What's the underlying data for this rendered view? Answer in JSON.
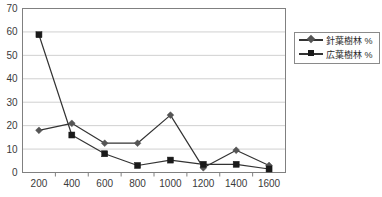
{
  "chart_data": {
    "type": "line",
    "title": "",
    "subtitle": "",
    "xlabel": "",
    "ylabel": "",
    "categories": [
      "200",
      "400",
      "600",
      "800",
      "1000",
      "1200",
      "1400",
      "1600"
    ],
    "series": [
      {
        "name": "針葉樹林 %",
        "marker": "diamond",
        "color": "#555555",
        "values": [
          18,
          21,
          12.5,
          12.5,
          24.5,
          2,
          9.5,
          3
        ]
      },
      {
        "name": "広葉樹林 %",
        "marker": "square",
        "color": "#1a1a1a",
        "values": [
          58.8,
          16,
          8,
          3,
          5.3,
          3.5,
          3.5,
          1.5
        ]
      }
    ],
    "ylim": [
      0,
      70
    ],
    "ytick_step": 10,
    "yticks": [
      "0",
      "10",
      "20",
      "30",
      "40",
      "50",
      "60",
      "70"
    ],
    "grid": "horizontal",
    "legend_position": "right",
    "frame_color": "#808080",
    "gridline_color": "#d0d0d0",
    "background": "#ffffff"
  },
  "legend": {
    "entries": [
      {
        "label": "針葉樹林 %"
      },
      {
        "label": "広葉樹林 %"
      }
    ]
  }
}
